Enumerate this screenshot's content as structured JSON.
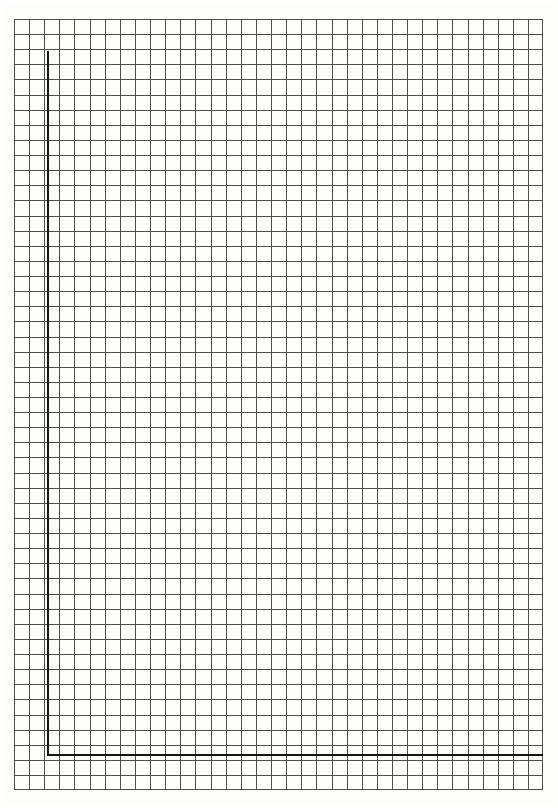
{
  "document": {
    "kind": "graph-paper",
    "title": "Blank squared graph paper sheet",
    "written_content": "",
    "annotations": []
  },
  "canvas": {
    "width": 558,
    "height": 808,
    "background_color": "#ffffff"
  },
  "paper": {
    "background_color": "#fdfdfc",
    "left": 0,
    "top": 0,
    "width": 558,
    "height": 808
  },
  "grid": {
    "left": 14,
    "top": 19,
    "right": 543,
    "bottom": 790,
    "width": 529,
    "height": 771,
    "cell_size": 15.12,
    "columns": 35,
    "rows": 51,
    "line_color": "#4e4e4e",
    "line_width": 1,
    "style": "square"
  },
  "margin_rule": {
    "label": "heavy margin rule",
    "color": "#151515",
    "thickness": 2,
    "vertical": {
      "x": 47,
      "y_start": 51,
      "y_end": 755
    },
    "horizontal": {
      "y": 754,
      "x_start": 47,
      "x_end": 543
    }
  },
  "chart_data": {
    "type": "table",
    "xlabel": "",
    "ylabel": "",
    "categories": [],
    "values": [],
    "grid": true,
    "legend": "none"
  }
}
